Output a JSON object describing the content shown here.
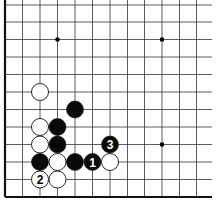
{
  "board": {
    "grid": {
      "x_lines": [
        5,
        22.5,
        40,
        57.5,
        75,
        92.5,
        110,
        127.5,
        144.5,
        162,
        179.5,
        196.5
      ],
      "y_lines": [
        5,
        22,
        39.5,
        57,
        74.5,
        92,
        109.5,
        127,
        144.5,
        162,
        179.5,
        197
      ],
      "left_edge_x": 5,
      "bottom_edge_y": 197,
      "line_extent_right": 212,
      "line_color": "#333333",
      "edge_color": "#111111"
    },
    "star_points": [
      {
        "x": 57.5,
        "y": 39.5
      },
      {
        "x": 162,
        "y": 39.5
      },
      {
        "x": 162,
        "y": 144.5
      }
    ],
    "stones": [
      {
        "color": "white",
        "x": 40,
        "y": 92,
        "label": ""
      },
      {
        "color": "black",
        "x": 75,
        "y": 109.5,
        "label": ""
      },
      {
        "color": "white",
        "x": 40,
        "y": 127,
        "label": ""
      },
      {
        "color": "black",
        "x": 57.5,
        "y": 127,
        "label": ""
      },
      {
        "color": "white",
        "x": 40,
        "y": 144.5,
        "label": ""
      },
      {
        "color": "black",
        "x": 57.5,
        "y": 144.5,
        "label": ""
      },
      {
        "color": "black",
        "x": 110,
        "y": 144.5,
        "label": "3"
      },
      {
        "color": "black",
        "x": 40,
        "y": 162,
        "label": ""
      },
      {
        "color": "white",
        "x": 57.5,
        "y": 162,
        "label": ""
      },
      {
        "color": "black",
        "x": 75,
        "y": 162,
        "label": ""
      },
      {
        "color": "black",
        "x": 92.5,
        "y": 162,
        "label": "1"
      },
      {
        "color": "white",
        "x": 110,
        "y": 162,
        "label": ""
      },
      {
        "color": "white",
        "x": 40,
        "y": 179.5,
        "label": "2"
      },
      {
        "color": "white",
        "x": 57.5,
        "y": 179.5,
        "label": ""
      }
    ],
    "stone_radius": 8.5
  }
}
